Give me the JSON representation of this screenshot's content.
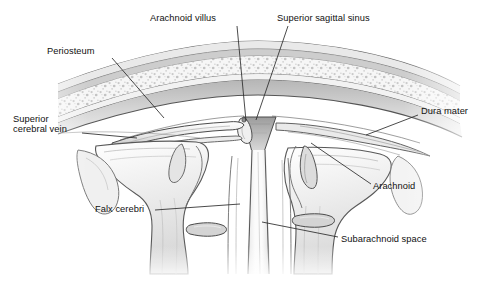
{
  "figure": {
    "type": "anatomical-illustration",
    "style": "grayscale medical line drawing with stipple and hatch shading",
    "background_color": "#ffffff",
    "width": 488,
    "height": 282,
    "ink_color": "#1a1a1a",
    "leader_color": "#2b2b2b"
  },
  "labels": [
    {
      "id": "arachnoid-villus",
      "text": "Arachnoid villus",
      "x": 150,
      "y": 13,
      "align": "left",
      "leader": {
        "x1": 237,
        "y1": 26,
        "x2": 246,
        "y2": 121
      }
    },
    {
      "id": "superior-sagittal-sinus",
      "text": "Superior sagittal sinus",
      "x": 277,
      "y": 13,
      "align": "left",
      "leader": {
        "x1": 288,
        "y1": 26,
        "x2": 256,
        "y2": 120
      }
    },
    {
      "id": "periosteum",
      "text": "Periosteum",
      "x": 47,
      "y": 46,
      "align": "left",
      "leader": {
        "x1": 112,
        "y1": 58,
        "x2": 164,
        "y2": 118
      }
    },
    {
      "id": "superior-cerebral-vein",
      "text": "Superior\ncerebral vein",
      "line1": "Superior",
      "line2": "cerebral vein",
      "x": 13,
      "y": 114,
      "align": "left",
      "leader": {
        "x1": 82,
        "y1": 133,
        "x2": 137,
        "y2": 138
      }
    },
    {
      "id": "dura-mater",
      "text": "Dura mater",
      "x": 421,
      "y": 106,
      "align": "left",
      "leader": {
        "x1": 418,
        "y1": 115,
        "x2": 366,
        "y2": 135
      }
    },
    {
      "id": "arachnoid",
      "text": "Arachnoid",
      "x": 373,
      "y": 181,
      "align": "left",
      "leader": {
        "x1": 371,
        "y1": 184,
        "x2": 311,
        "y2": 143
      }
    },
    {
      "id": "falx-cerebri",
      "text": "Falx cerebri",
      "x": 95,
      "y": 204,
      "align": "left",
      "leader": {
        "x1": 155,
        "y1": 210,
        "x2": 240,
        "y2": 204
      }
    },
    {
      "id": "subarachnoid-space",
      "text": "Subarachnoid space",
      "x": 341,
      "y": 234,
      "align": "left",
      "leader": {
        "x1": 338,
        "y1": 237,
        "x2": 262,
        "y2": 222
      }
    }
  ],
  "structures": [
    {
      "id": "scalp-outer-line",
      "name": "outer scalp / skin surface"
    },
    {
      "id": "outer-table",
      "name": "outer table of skull"
    },
    {
      "id": "diploe",
      "name": "diploe (spongy bone, stippled)"
    },
    {
      "id": "inner-table",
      "name": "inner table of skull"
    },
    {
      "id": "periosteal-dura",
      "name": "periosteal layer of dura mater"
    },
    {
      "id": "meningeal-dura",
      "name": "meningeal layer of dura mater"
    },
    {
      "id": "superior-sagittal-sinus-lumen",
      "name": "superior sagittal sinus lumen"
    },
    {
      "id": "arachnoid-villus-body",
      "name": "arachnoid villus projecting into sinus"
    },
    {
      "id": "superior-cerebral-vein-body",
      "name": "superior cerebral vein draining into sinus"
    },
    {
      "id": "falx-cerebri-body",
      "name": "falx cerebri (vertical dural fold)"
    },
    {
      "id": "arachnoid-membrane",
      "name": "arachnoid mater"
    },
    {
      "id": "subarachnoid-space-body",
      "name": "subarachnoid space with vessel"
    },
    {
      "id": "gyrus-left",
      "name": "left cerebral gyrus"
    },
    {
      "id": "gyrus-right",
      "name": "right cerebral gyrus"
    },
    {
      "id": "sulcus-left",
      "name": "left cerebral sulcus"
    },
    {
      "id": "sulcus-right",
      "name": "right cerebral sulcus"
    },
    {
      "id": "longitudinal-fissure",
      "name": "longitudinal fissure"
    }
  ]
}
